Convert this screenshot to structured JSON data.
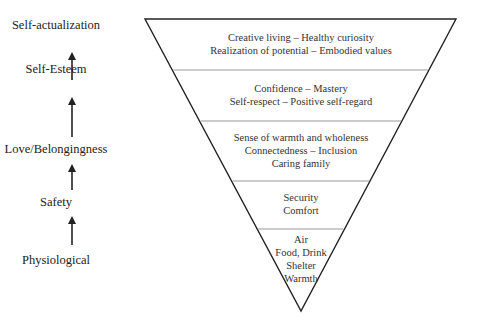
{
  "hierarchy_labels": [
    {
      "label": "Self-actualization",
      "y": 18
    },
    {
      "label": "Self-Esteem",
      "y": 62
    },
    {
      "label": "Love/Belongingness",
      "y": 142
    },
    {
      "label": "Safety",
      "y": 195
    },
    {
      "label": "Physiological",
      "y": 253
    }
  ],
  "arrows": [
    {
      "from_y": 80,
      "to_y": 56
    },
    {
      "from_y": 137,
      "to_y": 101
    },
    {
      "from_y": 190,
      "to_y": 168
    },
    {
      "from_y": 245,
      "to_y": 220
    }
  ],
  "pyramid": {
    "shape": "inverted-triangle",
    "stroke": "#222222",
    "divider_color": "#999999",
    "top_left": [
      145,
      19
    ],
    "top_right": [
      456,
      19
    ],
    "apex": [
      301,
      311
    ],
    "dividers_y": [
      70,
      121,
      181,
      229
    ],
    "bands": [
      {
        "level": "Self-actualization",
        "lines": [
          "Creative living – Healthy curiosity",
          "Realization of potential – Embodied values"
        ]
      },
      {
        "level": "Self-Esteem",
        "lines": [
          "Confidence – Mastery",
          "Self-respect – Positive self-regard"
        ]
      },
      {
        "level": "Love/Belongingness",
        "lines": [
          "Sense of warmth and wholeness",
          "Connectedness – Inclusion",
          "Caring family"
        ]
      },
      {
        "level": "Safety",
        "lines": [
          "Security",
          "Comfort"
        ]
      },
      {
        "level": "Physiological",
        "lines": [
          "Air",
          "Food, Drink",
          "Shelter",
          "Warmth"
        ]
      }
    ]
  }
}
